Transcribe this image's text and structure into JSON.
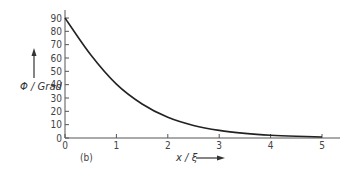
{
  "chart_data": {
    "type": "line",
    "title": "",
    "panel_label": "(b)",
    "xlabel": "x / ξ",
    "ylabel": "Φ / Grad",
    "xlim": [
      0,
      5
    ],
    "ylim": [
      0,
      90
    ],
    "xticks": [
      0,
      1,
      2,
      3,
      4,
      5
    ],
    "yticks": [
      0,
      10,
      20,
      30,
      40,
      50,
      60,
      70,
      80,
      90
    ],
    "grid": false,
    "legend": null,
    "series": [
      {
        "name": "Φ(x)",
        "x": [
          0,
          0.5,
          1,
          1.5,
          2,
          2.5,
          3,
          3.5,
          4,
          4.5,
          5
        ],
        "y": [
          90,
          62.4,
          40.4,
          25.5,
          15.5,
          9.4,
          5.7,
          3.5,
          2.1,
          1.3,
          0.8
        ]
      }
    ]
  }
}
